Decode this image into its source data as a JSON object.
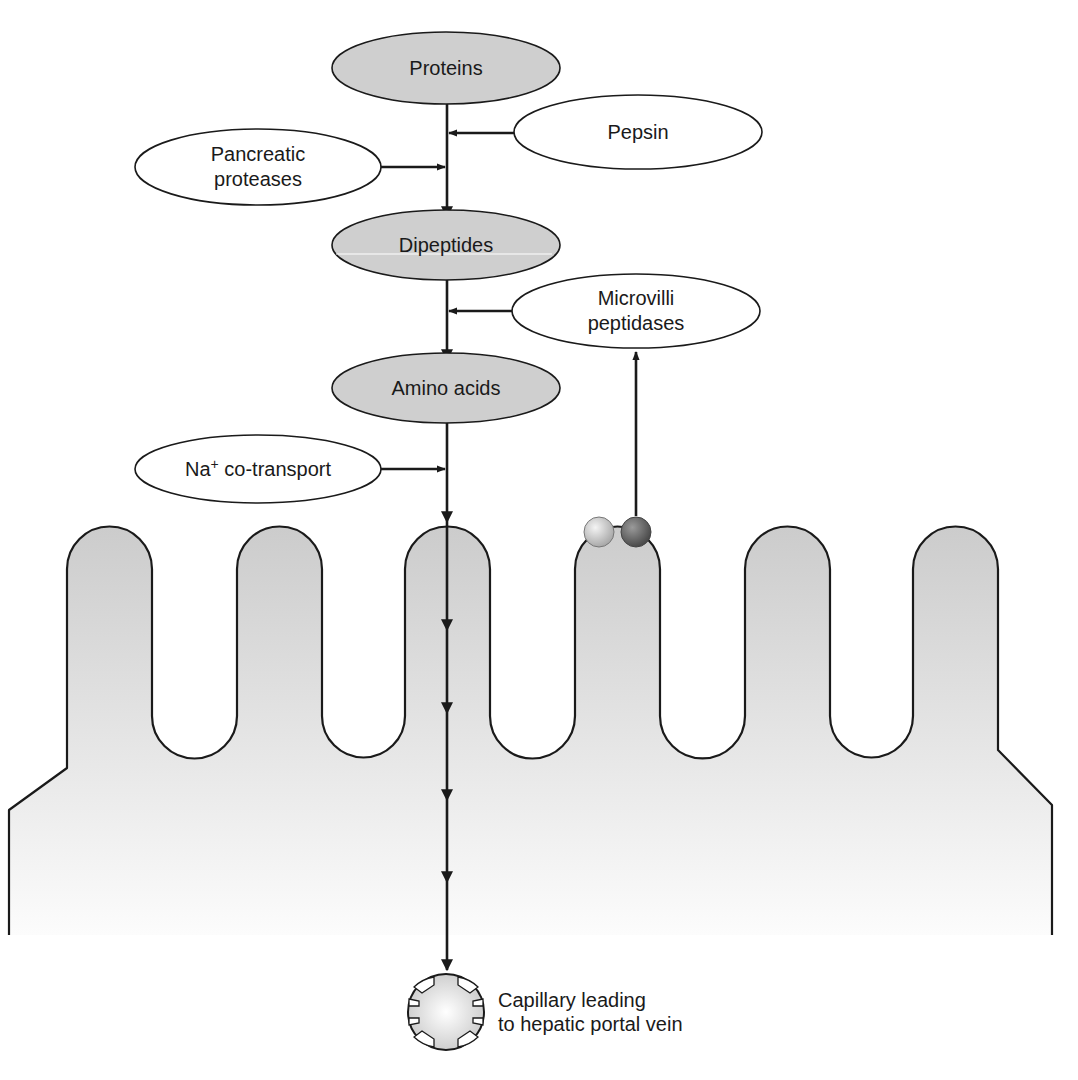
{
  "figure": {
    "title_partial": "",
    "substrates": [
      {
        "id": "proteins",
        "label": "Proteins",
        "cx": 446,
        "cy": 68
      },
      {
        "id": "dipeptides",
        "label": "Dipeptides",
        "cx": 446,
        "cy": 245
      },
      {
        "id": "amino_acids",
        "label": "Amino acids",
        "cx": 446,
        "cy": 388
      }
    ],
    "enzymes": [
      {
        "id": "pepsin",
        "label_lines": [
          "Pepsin"
        ],
        "cx": 638,
        "cy": 132
      },
      {
        "id": "pancreatic_proteases",
        "label_lines": [
          "Pancreatic",
          "proteases"
        ],
        "cx": 258,
        "cy": 167
      },
      {
        "id": "microvilli_peptidases",
        "label_lines": [
          "Microvilli",
          "peptidases"
        ],
        "cx": 636,
        "cy": 311
      },
      {
        "id": "na_cotransport",
        "label_base": "Na",
        "label_sup": "+",
        "label_rest": " co-transport",
        "cx": 258,
        "cy": 469
      }
    ],
    "capillary": {
      "label_lines": [
        "Capillary leading",
        "to hepatic portal vein"
      ]
    },
    "colors": {
      "substrate_fill": "#cfcfcf",
      "enzyme_fill": "#ffffff",
      "stroke": "#1a1a1a",
      "cell_top": "#cdcdcd",
      "cell_bottom": "#fbfbfb",
      "bead_light": "#d6d6d6",
      "bead_dark": "#6e6e6e"
    }
  }
}
